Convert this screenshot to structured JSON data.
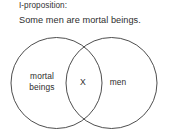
{
  "header": {
    "proposition_type": "I-proposition:",
    "statement": "Some men are mortal beings."
  },
  "diagram": {
    "type": "venn-two-circle",
    "left_circle_label": "mortal\nbeings",
    "right_circle_label": "men",
    "intersection_marker": "X",
    "stroke_color": "#3a3a3a",
    "fill_color": "#ffffff",
    "background_color": "#ffffff"
  }
}
